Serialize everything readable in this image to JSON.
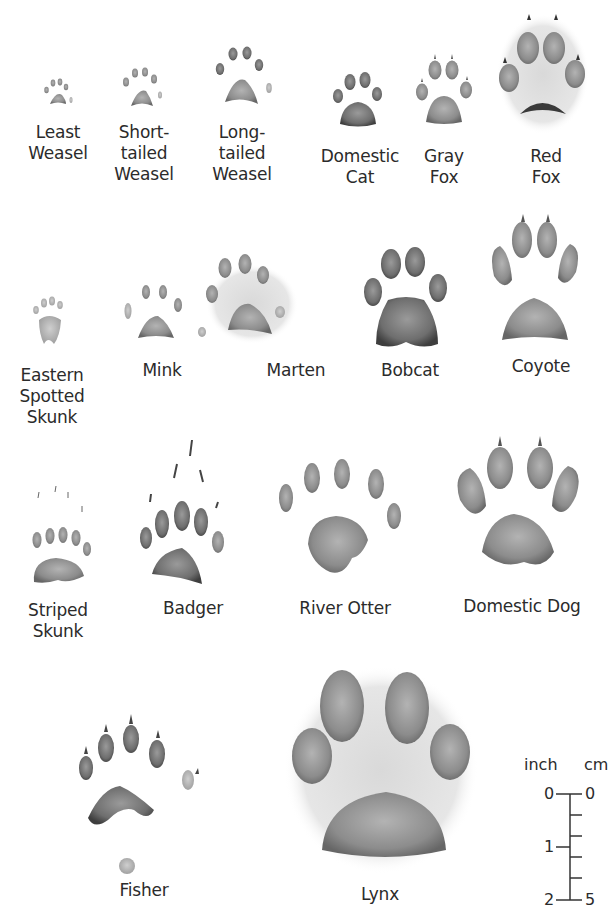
{
  "figure": {
    "prints": [
      {
        "id": "least-weasel",
        "label": "Least\nWeasel"
      },
      {
        "id": "short-tailed-weasel",
        "label": "Short-\ntailed\nWeasel"
      },
      {
        "id": "long-tailed-weasel",
        "label": "Long-\ntailed\nWeasel"
      },
      {
        "id": "domestic-cat",
        "label": "Domestic\nCat"
      },
      {
        "id": "gray-fox",
        "label": "Gray\nFox"
      },
      {
        "id": "red-fox",
        "label": "Red\nFox"
      },
      {
        "id": "eastern-spotted-skunk",
        "label": "Eastern\nSpotted\nSkunk"
      },
      {
        "id": "mink",
        "label": "Mink"
      },
      {
        "id": "marten",
        "label": "Marten"
      },
      {
        "id": "bobcat",
        "label": "Bobcat"
      },
      {
        "id": "coyote",
        "label": "Coyote"
      },
      {
        "id": "striped-skunk",
        "label": "Striped\nSkunk"
      },
      {
        "id": "badger",
        "label": "Badger"
      },
      {
        "id": "river-otter",
        "label": "River Otter"
      },
      {
        "id": "domestic-dog",
        "label": "Domestic Dog"
      },
      {
        "id": "fisher",
        "label": "Fisher"
      },
      {
        "id": "lynx",
        "label": "Lynx"
      }
    ],
    "scale": {
      "left_unit": "inch",
      "right_unit": "cm",
      "inch_ticks": [
        "0",
        "1",
        "2"
      ],
      "cm_ticks": [
        "0",
        "5"
      ]
    }
  },
  "colors": {
    "ink_dark": "#3a3a3a",
    "ink_mid": "#7a7a7a",
    "ink_light": "#b5b5b5",
    "background": "#ffffff"
  }
}
